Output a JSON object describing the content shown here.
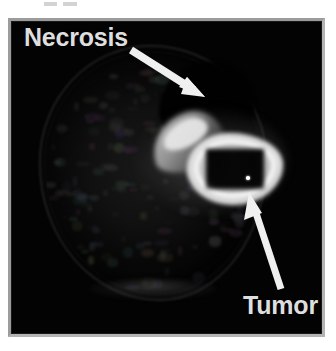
{
  "figure": {
    "type": "annotated-medical-scan",
    "modality_appearance": "grayscale axial brain scan",
    "background_color": "#ffffff",
    "frame_border_color": "#9c9c9c",
    "scan_background_color": "#000000",
    "annotation_color": "#dedede"
  },
  "annotations": [
    {
      "id": "necrosis",
      "label": "Necrosis",
      "arrow": {
        "icon": "arrow-icon",
        "direction": "down-right",
        "tail": {
          "x": 120,
          "y": 29
        },
        "tip": {
          "x": 190,
          "y": 73
        },
        "color": "#f0f0f0"
      },
      "label_position": {
        "x": 13,
        "y": 3
      }
    },
    {
      "id": "tumor",
      "label": "Tumor",
      "arrow": {
        "icon": "arrow-icon",
        "direction": "up-left",
        "tail": {
          "x": 270,
          "y": 268
        },
        "tip": {
          "x": 240,
          "y": 173
        },
        "color": "#f0f0f0"
      },
      "label_position": {
        "x": 232,
        "y": 271
      }
    }
  ],
  "regions": {
    "head": {
      "name": "head-outline",
      "description": "axial head cross-section"
    },
    "necrosis_cavity": {
      "name": "necrosis-region",
      "description": "dark non-enhancing necrotic cavity"
    },
    "tumor_lesion": {
      "name": "tumor-lesion",
      "description": "ring-enhancing mass with dark central necrosis",
      "rim_brightness": "high",
      "core_brightness": "low"
    },
    "marker_dot": {
      "name": "fiducial-dot",
      "description": "small bright point marker within lesion core"
    }
  }
}
